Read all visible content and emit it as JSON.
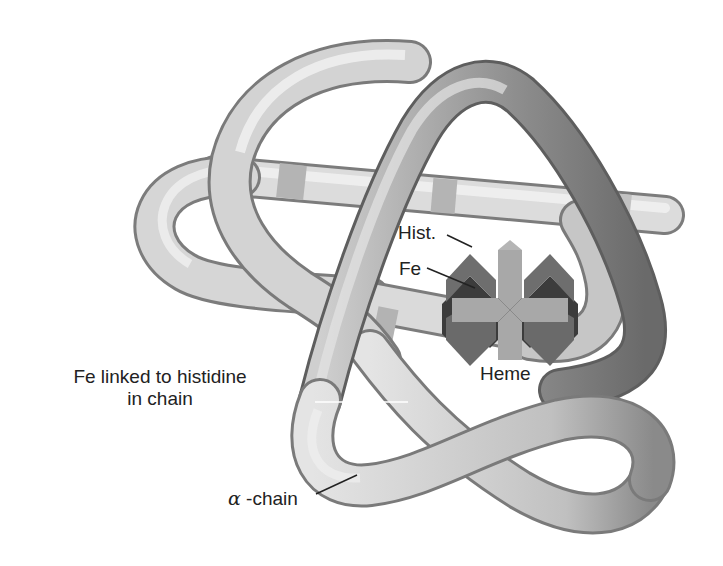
{
  "figure": {
    "colors": {
      "tube_light": "#eeeeee",
      "tube_mid": "#c4c4c4",
      "tube_dark": "#8c8c8c",
      "band_dark": "#b0b0b0",
      "heme_dark": "#6e6e6e",
      "heme_light": "#a9a9a9",
      "label_text": "#222222"
    }
  },
  "labels": {
    "fe_linked": {
      "line1": "Fe linked to histidine",
      "line2": "in chain"
    },
    "hist": "Hist.",
    "fe": "Fe",
    "heme": "Heme",
    "alpha_symbol": "α",
    "alpha_suffix": " -chain"
  }
}
